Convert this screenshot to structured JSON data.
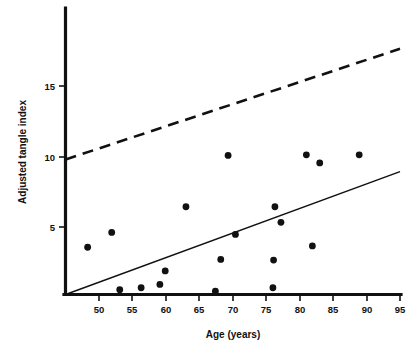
{
  "chart_data": {
    "type": "scatter",
    "title": "",
    "subtitle": "",
    "xlabel": "Age (years)",
    "ylabel": "Adjusted tangle index",
    "xlim": [
      45,
      95
    ],
    "ylim": [
      0,
      19
    ],
    "grid": false,
    "legend": null,
    "legend_position": "none",
    "xticks": [
      50,
      55,
      60,
      65,
      70,
      75,
      80,
      85,
      90,
      95
    ],
    "xtick_labels": [
      "50",
      "55",
      "60",
      "65",
      "70",
      "75",
      "80",
      "85",
      "90",
      "95"
    ],
    "yticks": [
      5,
      10,
      15
    ],
    "ytick_labels": [
      "5",
      "10",
      "15"
    ],
    "marker": "filled-circle",
    "marker_color": "#111111",
    "points": [
      {
        "x": 48.3,
        "y": 3.5
      },
      {
        "x": 51.9,
        "y": 4.6
      },
      {
        "x": 53.1,
        "y": 0.35
      },
      {
        "x": 56.3,
        "y": 0.5
      },
      {
        "x": 59.1,
        "y": 0.75
      },
      {
        "x": 59.9,
        "y": 1.75
      },
      {
        "x": 63.0,
        "y": 6.5
      },
      {
        "x": 67.4,
        "y": 0.25
      },
      {
        "x": 68.2,
        "y": 2.6
      },
      {
        "x": 69.3,
        "y": 10.3
      },
      {
        "x": 70.4,
        "y": 4.45
      },
      {
        "x": 76.0,
        "y": 0.5
      },
      {
        "x": 76.1,
        "y": 2.55
      },
      {
        "x": 76.3,
        "y": 6.5
      },
      {
        "x": 77.2,
        "y": 5.35
      },
      {
        "x": 81.0,
        "y": 10.35
      },
      {
        "x": 81.9,
        "y": 3.6
      },
      {
        "x": 83.0,
        "y": 9.75
      },
      {
        "x": 88.9,
        "y": 10.35
      }
    ],
    "series": [
      {
        "name": "regression-line",
        "style": "solid",
        "color": "#111111",
        "x": [
          45.0,
          95.0
        ],
        "values": [
          0.0,
          9.1
        ]
      },
      {
        "name": "reference-line",
        "style": "dashed",
        "color": "#111111",
        "x": [
          45.0,
          95.0
        ],
        "values": [
          10.0,
          18.2
        ]
      }
    ]
  },
  "axis": {
    "x_title": "Age (years)",
    "y_title": "Adjusted tangle index"
  }
}
